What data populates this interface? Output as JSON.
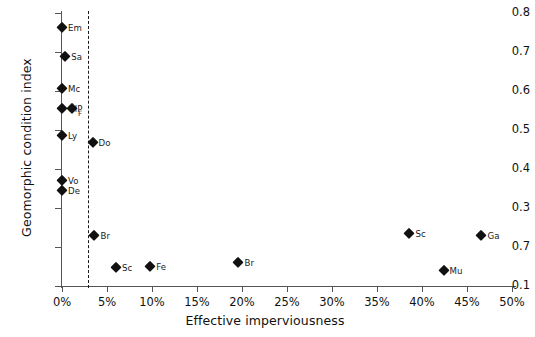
{
  "chart_data": {
    "type": "scatter",
    "title": "",
    "xlabel": "Effective imperviousness",
    "ylabel": "Geomorphic condition index",
    "xlim": [
      0,
      50
    ],
    "ylim": [
      0.1,
      0.8
    ],
    "grid": false,
    "legend": "none",
    "x_tick_labels": [
      "0%",
      "5%",
      "10%",
      "15%",
      "20%",
      "25%",
      "30%",
      "35%",
      "40%",
      "45%",
      "50%"
    ],
    "x_tick_values": [
      0,
      5,
      10,
      15,
      20,
      25,
      30,
      35,
      40,
      45,
      50
    ],
    "y_tick_labels": [
      "0.8",
      "0.7",
      "0.6",
      "0.5",
      "0.4",
      "0.3",
      "0.7",
      "0.1"
    ],
    "y_tick_values": [
      0.8,
      0.7,
      0.6,
      0.5,
      0.4,
      0.3,
      0.2,
      0.1
    ],
    "annotations": [
      {
        "name": "threshold-line",
        "type": "vertical-dashed-line",
        "x": 2.9
      }
    ],
    "points": [
      {
        "label": "Em",
        "x": 0.0,
        "y": 0.765
      },
      {
        "label": "Sa",
        "x": 0.35,
        "y": 0.69
      },
      {
        "label": "Mc",
        "x": 0.0,
        "y": 0.608
      },
      {
        "label": "OlP",
        "x": 0.0,
        "y": 0.556
      },
      {
        "label": "F",
        "x": 1.1,
        "y": 0.556
      },
      {
        "label": "Ly",
        "x": 0.0,
        "y": 0.487
      },
      {
        "label": "Do",
        "x": 3.4,
        "y": 0.47
      },
      {
        "label": "Vo",
        "x": 0.0,
        "y": 0.372
      },
      {
        "label": "De",
        "x": 0.0,
        "y": 0.345
      },
      {
        "label": "Br",
        "x": 3.6,
        "y": 0.232
      },
      {
        "label": "Sc",
        "x": 6.0,
        "y": 0.148
      },
      {
        "label": "Fe",
        "x": 9.8,
        "y": 0.152
      },
      {
        "label": "Br",
        "x": 19.6,
        "y": 0.162
      },
      {
        "label": "Sc",
        "x": 38.6,
        "y": 0.235
      },
      {
        "label": "Mu",
        "x": 42.4,
        "y": 0.142
      },
      {
        "label": "Ga",
        "x": 46.6,
        "y": 0.232
      }
    ]
  }
}
